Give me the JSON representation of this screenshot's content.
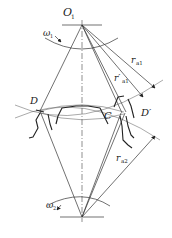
{
  "diagram": {
    "type": "gear-meshing-geometry",
    "labels": {
      "o1": "O",
      "o1_sub": "1",
      "omega1": "ω",
      "omega1_sub": "1",
      "omega2": "ω",
      "omega2_sub": "2",
      "ra1": "r",
      "ra1_sub": "a1",
      "ra1_prime": "r′",
      "ra1_prime_sub": "a1",
      "ra2": "r",
      "ra2_sub": "a2",
      "d": "D",
      "d_prime": "D′",
      "c": "C"
    },
    "points": {
      "O1": [
        82,
        25
      ],
      "O2": [
        82,
        217
      ],
      "D": [
        40,
        111
      ],
      "D_prime": [
        124,
        112
      ],
      "C": [
        122,
        113
      ]
    },
    "colors": {
      "stroke": "#333333",
      "background": "#ffffff"
    }
  }
}
